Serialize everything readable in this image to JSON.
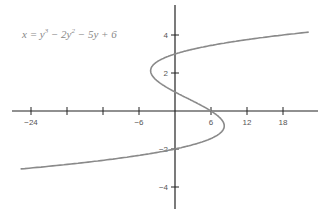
{
  "chart_data": {
    "type": "line",
    "equation": {
      "base": "x = y",
      "exp1": "3",
      "mid": " − 2y",
      "exp2": "2",
      "tail": " − 5y + 6"
    },
    "xlabel": "",
    "ylabel": "",
    "x_ticks": [
      -24,
      -18,
      -12,
      -6,
      6,
      12,
      18
    ],
    "x_tick_labels": [
      "−24",
      "",
      "",
      "−6",
      "6",
      "12",
      "18"
    ],
    "y_ticks": [
      4,
      2,
      -2,
      -4
    ],
    "y_tick_labels": [
      "4",
      "2",
      "−2",
      "−4"
    ],
    "xlim": [
      -26,
      23
    ],
    "ylim": [
      -5.2,
      5.6
    ],
    "grid": false,
    "series": [
      {
        "name": "x = y^3 - 2y^2 - 5y + 6",
        "y_range": [
          -3.05,
          4.15
        ],
        "color": "#8a8a8a"
      }
    ],
    "key_points": [
      {
        "x": 0,
        "y": 3
      },
      {
        "x": 0,
        "y": 1
      },
      {
        "x": 0,
        "y": -2
      },
      {
        "x": 6,
        "y": 0
      }
    ]
  }
}
